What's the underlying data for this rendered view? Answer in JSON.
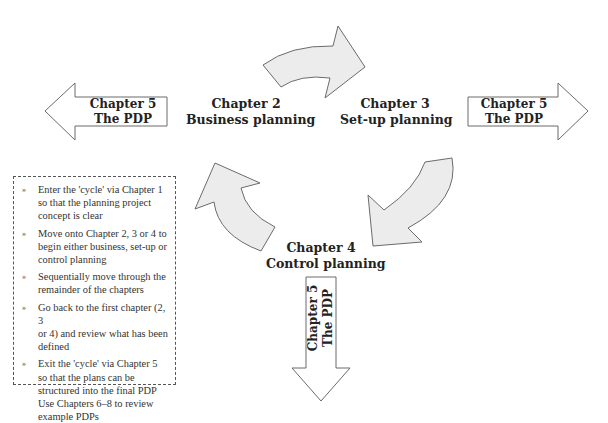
{
  "nodes": {
    "chapter2": {
      "line1": "Chapter 2",
      "line2": "Business planning"
    },
    "chapter3": {
      "line1": "Chapter 3",
      "line2": "Set-up planning"
    },
    "chapter4": {
      "line1": "Chapter 4",
      "line2": "Control planning"
    }
  },
  "exit_arrows": {
    "left": {
      "line1": "Chapter 5",
      "line2": "The PDP"
    },
    "right": {
      "line1": "Chapter 5",
      "line2": "The PDP"
    },
    "down": {
      "line1": "Chapter 5",
      "line2": "The PDP"
    }
  },
  "cycle_arrows": [
    {
      "from": "Chapter 2",
      "to": "Chapter 3"
    },
    {
      "from": "Chapter 3",
      "to": "Chapter 4"
    },
    {
      "from": "Chapter 4",
      "to": "Chapter 2"
    }
  ],
  "notes": {
    "bullet_icon": "»",
    "items": [
      {
        "lines": [
          "Enter the 'cycle' via Chapter 1",
          "so that the planning project",
          "concept is clear"
        ]
      },
      {
        "lines": [
          "Move onto Chapter 2, 3 or 4 to",
          "begin either business, set-up or",
          "control planning"
        ]
      },
      {
        "lines": [
          "Sequentially move through the",
          "remainder of the chapters"
        ]
      },
      {
        "lines": [
          "Go back to the first chapter (2, 3",
          "or 4) and review what has been",
          "defined"
        ]
      },
      {
        "lines": [
          "Exit the 'cycle' via Chapter 5",
          "so that the plans can be",
          "structured into the final PDP",
          "Use Chapters 6–8 to review",
          "example PDPs"
        ]
      }
    ]
  },
  "colors": {
    "arrow_fill_curved": "#ececec",
    "arrow_fill_straight": "#ffffff",
    "stroke": "#6b6b6b"
  }
}
